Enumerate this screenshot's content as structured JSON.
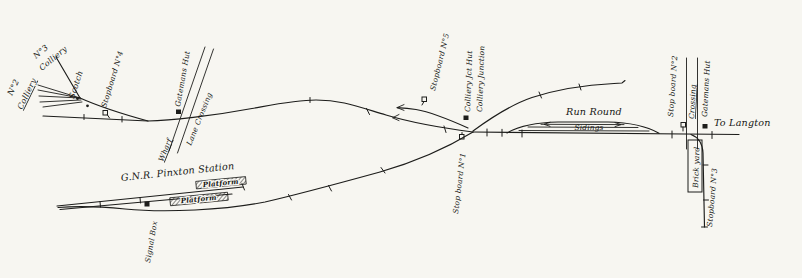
{
  "page": {
    "background": "#f7f6f1",
    "ink": "#1d1d1b"
  },
  "labels": {
    "colliery2_line1": "N°2",
    "colliery2_line2": "Colliery",
    "colliery3_line1": "N°3",
    "colliery3_line2": "Colliery",
    "scotch": "Scotch",
    "stopboard4": "Stopboard N°4",
    "gatemans_hut_west": "Gatemans Hut",
    "lane_crossing": "Lane Crossing",
    "wharf": "Wharf",
    "stopboard5": "Stopboard N°5",
    "colliery_jct_hut": "Colliery Jct Hut",
    "colliery_junction": "Colliery Junction",
    "stopboard1": "Stop board N°1",
    "run_round": "Run Round",
    "sidings": "Sidings",
    "stopboard2": "Stop board N°2",
    "crossing": "Crossing",
    "gatemans_hut_east": "Gatemans Hut",
    "to_langton": "To Langton",
    "brick_yard": "Brick yard",
    "stopboard3": "Stopboard N°3",
    "station_name": "G.N.R. Pinxton Station",
    "platform_upper": "Platform",
    "platform_lower": "Platform",
    "signal_box": "Signal Box"
  }
}
